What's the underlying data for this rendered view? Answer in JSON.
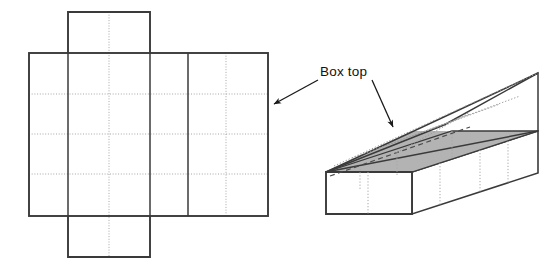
{
  "figure": {
    "background_color": "#ffffff",
    "width": 560,
    "height": 266,
    "labels": {
      "box_top": "Box top"
    },
    "colors": {
      "stroke_solid": "#3a3a3a",
      "stroke_fold_dotted": "#9a9a9a",
      "stroke_hidden_dashed": "#555555",
      "lid_fill": "#b3b3b3",
      "face_fill": "#ffffff",
      "text": "#111111",
      "leader_line": "#1a1a1a"
    },
    "net": {
      "name": "unfolded-box-net",
      "description": "Flat cardboard net with a central body grid, a top flap and a bottom flap",
      "outline_left_x": 29,
      "outline_right_x": 268,
      "body_top_y": 53,
      "body_bottom_y": 216,
      "flap_left_x": 68,
      "flap_right_x": 150,
      "top_flap_top_y": 12,
      "bottom_flap_bottom_y": 257,
      "solid_vertical_lines_x": [
        68,
        150,
        188
      ],
      "dotted_vertical_lines_x": [
        109,
        226
      ],
      "dotted_horizontal_lines_y": [
        94,
        134,
        174
      ],
      "columns": 6,
      "rows": 4
    },
    "box3d": {
      "name": "assembled-box-with-open-lid",
      "description": "Long rectangular box drawn in oblique projection with an open angled lid shaded grey",
      "front_face": {
        "top_left": [
          326,
          172
        ],
        "top_right": [
          412,
          172
        ],
        "bottom_right": [
          412,
          214
        ],
        "bottom_left": [
          326,
          214
        ]
      },
      "lid_apex": [
        538,
        73
      ],
      "back_top_right": [
        538,
        131
      ],
      "hidden_edges_dashed": true,
      "fold_lines_dotted": true
    },
    "leaders": [
      {
        "name": "leader-to-net",
        "from": [
          318,
          80
        ],
        "to": [
          270,
          105
        ],
        "arrowhead": "left"
      },
      {
        "name": "leader-to-box",
        "from": [
          372,
          80
        ],
        "to": [
          396,
          130
        ],
        "arrowhead": "down-right"
      }
    ]
  }
}
